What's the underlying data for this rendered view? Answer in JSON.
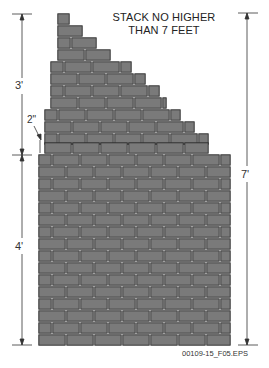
{
  "caption": {
    "line1": "STACK NO HIGHER",
    "line2": "THAN 7 FEET"
  },
  "dimensions": {
    "upper_label": "3'",
    "lower_label": "4'",
    "total_label": "7'",
    "setback_label": "2\""
  },
  "file_label": "00109-15_F05.EPS",
  "colors": {
    "brick_fill": "#7a7a7a",
    "brick_stroke": "#2a2a2a",
    "mortar": "#e8e8e8",
    "line": "#333333"
  },
  "wall": {
    "row_height": 12,
    "brick_width": 28,
    "half_brick": 14,
    "rows": [
      {
        "y": 13,
        "x0": 57,
        "x1": 70,
        "offset": 0
      },
      {
        "y": 25,
        "x0": 57,
        "x1": 83,
        "offset": 0
      },
      {
        "y": 37,
        "x0": 57,
        "x1": 97,
        "offset": 14
      },
      {
        "y": 49,
        "x0": 57,
        "x1": 111,
        "offset": 0
      },
      {
        "y": 61,
        "x0": 50,
        "x1": 132,
        "offset": 14
      },
      {
        "y": 73,
        "x0": 50,
        "x1": 146,
        "offset": 0
      },
      {
        "y": 85,
        "x0": 50,
        "x1": 160,
        "offset": 14
      },
      {
        "y": 97,
        "x0": 50,
        "x1": 167,
        "offset": 0
      },
      {
        "y": 109,
        "x0": 44,
        "x1": 181,
        "offset": 14
      },
      {
        "y": 121,
        "x0": 44,
        "x1": 195,
        "offset": 0
      },
      {
        "y": 133,
        "x0": 44,
        "x1": 209,
        "offset": 14
      },
      {
        "y": 142,
        "x0": 44,
        "x1": 209,
        "offset": 0
      },
      {
        "y": 154,
        "x0": 38,
        "x1": 231,
        "offset": 14
      },
      {
        "y": 166,
        "x0": 38,
        "x1": 231,
        "offset": 0
      },
      {
        "y": 178,
        "x0": 38,
        "x1": 231,
        "offset": 14
      },
      {
        "y": 190,
        "x0": 38,
        "x1": 231,
        "offset": 0
      },
      {
        "y": 202,
        "x0": 38,
        "x1": 231,
        "offset": 14
      },
      {
        "y": 214,
        "x0": 38,
        "x1": 231,
        "offset": 0
      },
      {
        "y": 226,
        "x0": 38,
        "x1": 231,
        "offset": 14
      },
      {
        "y": 238,
        "x0": 38,
        "x1": 231,
        "offset": 0
      },
      {
        "y": 250,
        "x0": 38,
        "x1": 231,
        "offset": 14
      },
      {
        "y": 262,
        "x0": 38,
        "x1": 231,
        "offset": 0
      },
      {
        "y": 274,
        "x0": 38,
        "x1": 231,
        "offset": 14
      },
      {
        "y": 286,
        "x0": 38,
        "x1": 231,
        "offset": 0
      },
      {
        "y": 298,
        "x0": 38,
        "x1": 231,
        "offset": 14
      },
      {
        "y": 310,
        "x0": 38,
        "x1": 231,
        "offset": 0
      },
      {
        "y": 322,
        "x0": 38,
        "x1": 231,
        "offset": 14
      },
      {
        "y": 334,
        "x0": 38,
        "x1": 231,
        "offset": 0
      }
    ]
  }
}
